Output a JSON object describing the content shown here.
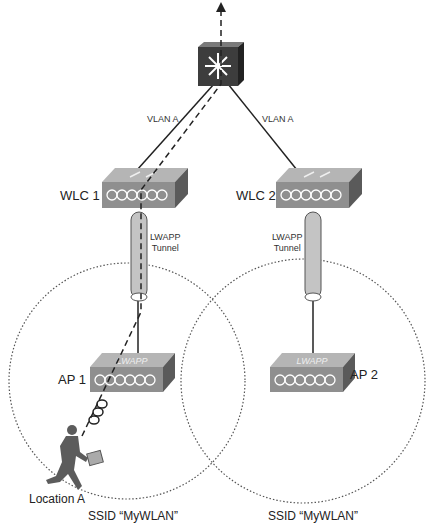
{
  "diagram": {
    "type": "network-roaming-topology",
    "core_switch": {
      "name": "multilayer-switch",
      "label": ""
    },
    "links": [
      {
        "from": "core_switch",
        "to": "WLC 1",
        "label": "VLAN A"
      },
      {
        "from": "core_switch",
        "to": "WLC 2",
        "label": "VLAN A"
      }
    ],
    "controllers": [
      {
        "label": "WLC 1"
      },
      {
        "label": "WLC 2"
      }
    ],
    "tunnels": [
      {
        "label_line1": "LWAPP",
        "label_line2": "Tunnel"
      },
      {
        "label_line1": "LWAPP",
        "label_line2": "Tunnel"
      }
    ],
    "access_points": [
      {
        "label": "AP 1",
        "face_text": "LWAPP"
      },
      {
        "label": "AP 2",
        "face_text": "LWAPP"
      }
    ],
    "cells": [
      {
        "ssid_label": "SSID “MyWLAN”"
      },
      {
        "ssid_label": "SSID “MyWLAN”"
      }
    ],
    "client": {
      "location_label": "Location A"
    },
    "colors": {
      "device_front": "#8f8f8f",
      "device_top": "#b5b5b5",
      "device_side": "#5a5a5a",
      "switch_dark": "#3d3d3d",
      "tunnel": "#c4c4c4",
      "line": "#222222",
      "cell_border": "#555555"
    }
  }
}
